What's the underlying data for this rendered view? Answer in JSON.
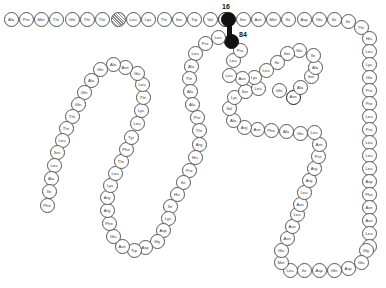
{
  "diagram": {
    "title": "",
    "labels": {
      "n16": "16",
      "n84": "84"
    },
    "residues": [
      {
        "aa": "Ala",
        "x": 11,
        "y": 19
      },
      {
        "aa": "Pro",
        "x": 26,
        "y": 19
      },
      {
        "aa": "Met",
        "x": 41,
        "y": 19
      },
      {
        "aa": "Thr",
        "x": 56,
        "y": 19
      },
      {
        "aa": "Gln",
        "x": 72,
        "y": 19
      },
      {
        "aa": "Thr",
        "x": 87,
        "y": 19
      },
      {
        "aa": "Thr",
        "x": 102,
        "y": 19
      },
      {
        "aa": "",
        "x": 118,
        "y": 19,
        "style": "hatched"
      },
      {
        "aa": "Leu",
        "x": 133,
        "y": 19
      },
      {
        "aa": "Lys",
        "x": 148,
        "y": 19
      },
      {
        "aa": "Thr",
        "x": 164,
        "y": 19
      },
      {
        "aa": "Ser",
        "x": 179,
        "y": 19
      },
      {
        "aa": "Trp",
        "x": 194,
        "y": 19
      },
      {
        "aa": "Val",
        "x": 210,
        "y": 19
      },
      {
        "aa": "Asn",
        "x": 225,
        "y": 19,
        "style": "bold"
      },
      {
        "aa": "",
        "x": 228,
        "y": 19,
        "style": "black"
      },
      {
        "aa": "Ser",
        "x": 243,
        "y": 19
      },
      {
        "aa": "Asn",
        "x": 258,
        "y": 19
      },
      {
        "aa": "Met",
        "x": 273,
        "y": 19
      },
      {
        "aa": "Ile",
        "x": 288,
        "y": 19
      },
      {
        "aa": "Asp",
        "x": 304,
        "y": 19
      },
      {
        "aa": "Glu",
        "x": 319,
        "y": 19
      },
      {
        "aa": "Ile",
        "x": 334,
        "y": 19
      },
      {
        "aa": "Ile",
        "x": 348,
        "y": 21
      },
      {
        "aa": "Thr",
        "x": 361,
        "y": 27
      },
      {
        "aa": "His",
        "x": 369,
        "y": 38
      },
      {
        "aa": "Leu",
        "x": 369,
        "y": 51
      },
      {
        "aa": "Lys",
        "x": 369,
        "y": 64
      },
      {
        "aa": "Gln",
        "x": 369,
        "y": 77
      },
      {
        "aa": "Pro",
        "x": 369,
        "y": 90
      },
      {
        "aa": "Pro",
        "x": 369,
        "y": 103
      },
      {
        "aa": "Leu",
        "x": 369,
        "y": 116
      },
      {
        "aa": "Pro",
        "x": 369,
        "y": 129
      },
      {
        "aa": "Leu",
        "x": 369,
        "y": 142
      },
      {
        "aa": "Leu",
        "x": 369,
        "y": 155
      },
      {
        "aa": "Leu",
        "x": 369,
        "y": 168
      },
      {
        "aa": "Asp",
        "x": 369,
        "y": 181
      },
      {
        "aa": "Phe",
        "x": 369,
        "y": 194
      },
      {
        "aa": "Asn",
        "x": 369,
        "y": 207
      },
      {
        "aa": "Asn",
        "x": 369,
        "y": 220
      },
      {
        "aa": "Leu",
        "x": 369,
        "y": 233
      },
      {
        "aa": "Asn",
        "x": 369,
        "y": 246
      },
      {
        "aa": "Gly",
        "x": 366,
        "y": 250
      },
      {
        "aa": "Glu",
        "x": 361,
        "y": 262
      },
      {
        "aa": "Asp",
        "x": 348,
        "y": 268
      },
      {
        "aa": "Gln",
        "x": 334,
        "y": 270
      },
      {
        "aa": "Asp",
        "x": 319,
        "y": 270
      },
      {
        "aa": "Ile",
        "x": 304,
        "y": 270
      },
      {
        "aa": "Leu",
        "x": 290,
        "y": 270
      },
      {
        "aa": "Met",
        "x": 281,
        "y": 262
      },
      {
        "aa": "Glu",
        "x": 281,
        "y": 250
      },
      {
        "aa": "Asn",
        "x": 287,
        "y": 238
      },
      {
        "aa": "Asn",
        "x": 292,
        "y": 226
      },
      {
        "aa": "Leu",
        "x": 297,
        "y": 214
      },
      {
        "aa": "Asn",
        "x": 300,
        "y": 204
      },
      {
        "aa": "Leu",
        "x": 304,
        "y": 192
      },
      {
        "aa": "Arg",
        "x": 309,
        "y": 180
      },
      {
        "aa": "Arg",
        "x": 314,
        "y": 168
      },
      {
        "aa": "Pro",
        "x": 318,
        "y": 156
      },
      {
        "aa": "Asn",
        "x": 319,
        "y": 144
      },
      {
        "aa": "Leu",
        "x": 314,
        "y": 132
      },
      {
        "aa": "Glu",
        "x": 300,
        "y": 133
      },
      {
        "aa": "Ala",
        "x": 286,
        "y": 131
      },
      {
        "aa": "Phe",
        "x": 271,
        "y": 130
      },
      {
        "aa": "Asn",
        "x": 257,
        "y": 129
      },
      {
        "aa": "Arg",
        "x": 244,
        "y": 127
      },
      {
        "aa": "Ala",
        "x": 233,
        "y": 120
      },
      {
        "aa": "Val",
        "x": 229,
        "y": 108
      },
      {
        "aa": "Lys",
        "x": 234,
        "y": 97
      },
      {
        "aa": "Ser",
        "x": 245,
        "y": 91
      },
      {
        "aa": "Leu",
        "x": 258,
        "y": 88
      },
      {
        "aa": "Gln",
        "x": 279,
        "y": 90
      },
      {
        "aa": "Asn",
        "x": 293,
        "y": 97,
        "style": "bold"
      },
      {
        "aa": "Ala",
        "x": 300,
        "y": 87
      },
      {
        "aa": "Ser",
        "x": 311,
        "y": 76
      },
      {
        "aa": "Ala",
        "x": 315,
        "y": 67
      },
      {
        "aa": "Ile",
        "x": 313,
        "y": 55
      },
      {
        "aa": "Glu",
        "x": 299,
        "y": 50
      },
      {
        "aa": "Ser",
        "x": 287,
        "y": 53
      },
      {
        "aa": "Ile",
        "x": 277,
        "y": 62
      },
      {
        "aa": "Leu",
        "x": 266,
        "y": 70
      },
      {
        "aa": "Lys",
        "x": 254,
        "y": 77
      },
      {
        "aa": "Asn",
        "x": 242,
        "y": 78
      },
      {
        "aa": "Leu",
        "x": 229,
        "y": 75
      },
      {
        "aa": "Leu",
        "x": 233,
        "y": 60
      },
      {
        "aa": "Pro",
        "x": 240,
        "y": 50
      },
      {
        "aa": "",
        "x": 231,
        "y": 41,
        "style": "black"
      },
      {
        "aa": "Leu",
        "x": 218,
        "y": 37
      },
      {
        "aa": "Pro",
        "x": 205,
        "y": 43
      },
      {
        "aa": "Leu",
        "x": 195,
        "y": 53
      },
      {
        "aa": "Ala",
        "x": 191,
        "y": 66
      },
      {
        "aa": "Thr",
        "x": 189,
        "y": 78
      },
      {
        "aa": "Ala",
        "x": 190,
        "y": 91
      },
      {
        "aa": "Ala",
        "x": 192,
        "y": 104
      },
      {
        "aa": "Pro",
        "x": 197,
        "y": 117
      },
      {
        "aa": "Thr",
        "x": 199,
        "y": 130
      },
      {
        "aa": "Arg",
        "x": 199,
        "y": 144
      },
      {
        "aa": "His",
        "x": 195,
        "y": 157
      },
      {
        "aa": "Pro",
        "x": 189,
        "y": 170
      },
      {
        "aa": "Ile",
        "x": 183,
        "y": 182
      },
      {
        "aa": "His",
        "x": 177,
        "y": 194
      },
      {
        "aa": "Ile",
        "x": 170,
        "y": 206
      },
      {
        "aa": "Lys",
        "x": 168,
        "y": 218
      },
      {
        "aa": "Asp",
        "x": 163,
        "y": 230
      },
      {
        "aa": "Gly",
        "x": 157,
        "y": 241
      },
      {
        "aa": "Asp",
        "x": 145,
        "y": 247
      },
      {
        "aa": "Trp",
        "x": 134,
        "y": 250
      },
      {
        "aa": "Asn",
        "x": 122,
        "y": 246
      },
      {
        "aa": "Glu",
        "x": 113,
        "y": 236
      },
      {
        "aa": "Phe",
        "x": 109,
        "y": 223
      },
      {
        "aa": "Arg",
        "x": 107,
        "y": 210
      },
      {
        "aa": "Arg",
        "x": 107,
        "y": 197
      },
      {
        "aa": "Lys",
        "x": 110,
        "y": 185
      },
      {
        "aa": "Leu",
        "x": 115,
        "y": 173
      },
      {
        "aa": "Thr",
        "x": 121,
        "y": 161
      },
      {
        "aa": "Phe",
        "x": 126,
        "y": 149
      },
      {
        "aa": "Tyr",
        "x": 131,
        "y": 137
      },
      {
        "aa": "Leu",
        "x": 137,
        "y": 123
      },
      {
        "aa": "Lys",
        "x": 141,
        "y": 110
      },
      {
        "aa": "Thr",
        "x": 143,
        "y": 97
      },
      {
        "aa": "Leu",
        "x": 142,
        "y": 84
      },
      {
        "aa": "Glu",
        "x": 137,
        "y": 73
      },
      {
        "aa": "Asn",
        "x": 125,
        "y": 67
      },
      {
        "aa": "Ala",
        "x": 113,
        "y": 64
      },
      {
        "aa": "Gln",
        "x": 100,
        "y": 69
      },
      {
        "aa": "Ala",
        "x": 91,
        "y": 80
      },
      {
        "aa": "Gln",
        "x": 84,
        "y": 92
      },
      {
        "aa": "Gln",
        "x": 78,
        "y": 104
      },
      {
        "aa": "Thr",
        "x": 72,
        "y": 116
      },
      {
        "aa": "Thr",
        "x": 66,
        "y": 128
      },
      {
        "aa": "Leu",
        "x": 62,
        "y": 140
      },
      {
        "aa": "Ser",
        "x": 57,
        "y": 152
      },
      {
        "aa": "Leu",
        "x": 54,
        "y": 165
      },
      {
        "aa": "Ala",
        "x": 51,
        "y": 178
      },
      {
        "aa": "Ile",
        "x": 49,
        "y": 191
      },
      {
        "aa": "Phe",
        "x": 47,
        "y": 205
      }
    ]
  }
}
